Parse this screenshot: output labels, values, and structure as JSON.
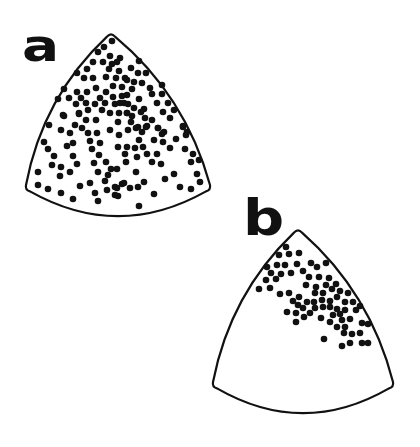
{
  "figure": {
    "background": "#ffffff",
    "stroke_color": "#111111",
    "dot_color": "#111111",
    "dot_radius": 3.3,
    "panels": [
      {
        "label": "a",
        "outline": {
          "top": [
            111,
            33
          ],
          "bottom_left": [
            26,
            189
          ],
          "bottom_right": [
            210,
            189
          ],
          "bottom_sag": 215
        },
        "dots": [
          [
            112,
            41
          ],
          [
            104,
            47
          ],
          [
            110,
            56
          ],
          [
            120,
            58
          ],
          [
            93,
            62
          ],
          [
            103,
            62
          ],
          [
            112,
            64
          ],
          [
            117,
            62
          ],
          [
            87,
            69
          ],
          [
            109,
            69
          ],
          [
            119,
            71
          ],
          [
            77,
            73
          ],
          [
            84,
            78
          ],
          [
            93,
            78
          ],
          [
            106,
            77
          ],
          [
            116,
            78
          ],
          [
            125,
            78
          ],
          [
            64,
            89
          ],
          [
            96,
            88
          ],
          [
            113,
            86
          ],
          [
            122,
            87
          ],
          [
            77,
            92
          ],
          [
            87,
            92
          ],
          [
            106,
            92
          ],
          [
            58,
            99
          ],
          [
            69,
            98
          ],
          [
            81,
            98
          ],
          [
            100,
            98
          ],
          [
            113,
            97
          ],
          [
            122,
            96
          ],
          [
            76,
            104
          ],
          [
            86,
            103
          ],
          [
            95,
            104
          ],
          [
            105,
            103
          ],
          [
            115,
            104
          ],
          [
            124,
            103
          ],
          [
            79,
            113
          ],
          [
            88,
            110
          ],
          [
            102,
            110
          ],
          [
            110,
            113
          ],
          [
            119,
            113
          ],
          [
            127,
            113
          ],
          [
            64,
            116
          ],
          [
            139,
            61
          ],
          [
            131,
            68
          ],
          [
            138,
            73
          ],
          [
            146,
            73
          ],
          [
            127,
            80
          ],
          [
            134,
            82
          ],
          [
            142,
            83
          ],
          [
            132,
            89
          ],
          [
            162,
            85
          ],
          [
            152,
            94
          ],
          [
            162,
            94
          ],
          [
            139,
            99
          ],
          [
            157,
            103
          ],
          [
            168,
            103
          ],
          [
            128,
            104
          ],
          [
            134,
            108
          ],
          [
            144,
            109
          ],
          [
            163,
            112
          ],
          [
            174,
            110
          ],
          [
            127,
            113
          ],
          [
            170,
            118
          ],
          [
            145,
            118
          ],
          [
            152,
            120
          ],
          [
            131,
            122
          ],
          [
            138,
            127
          ],
          [
            147,
            126
          ],
          [
            158,
            128
          ],
          [
            183,
            126
          ],
          [
            187,
            132
          ],
          [
            164,
            132
          ],
          [
            63,
            115
          ],
          [
            79,
            114
          ],
          [
            49,
            125
          ],
          [
            75,
            125
          ],
          [
            82,
            128
          ],
          [
            61,
            130
          ],
          [
            70,
            133
          ],
          [
            88,
            133
          ],
          [
            97,
            133
          ],
          [
            44,
            142
          ],
          [
            73,
            143
          ],
          [
            90,
            141
          ],
          [
            100,
            143
          ],
          [
            48,
            149
          ],
          [
            67,
            146
          ],
          [
            92,
            149
          ],
          [
            54,
            156
          ],
          [
            73,
            156
          ],
          [
            99,
            155
          ],
          [
            106,
            162
          ],
          [
            52,
            165
          ],
          [
            77,
            164
          ],
          [
            94,
            163
          ],
          [
            38,
            172
          ],
          [
            61,
            167
          ],
          [
            70,
            172
          ],
          [
            98,
            172
          ],
          [
            111,
            169
          ],
          [
            60,
            176
          ],
          [
            108,
            175
          ],
          [
            90,
            183
          ],
          [
            105,
            181
          ],
          [
            122,
            184
          ],
          [
            38,
            185
          ],
          [
            48,
            189
          ],
          [
            61,
            193
          ],
          [
            80,
            186
          ],
          [
            95,
            193
          ],
          [
            107,
            190
          ],
          [
            115,
            187
          ],
          [
            115,
            195
          ],
          [
            73,
            199
          ],
          [
            98,
            201
          ],
          [
            128,
            130
          ],
          [
            136,
            128
          ],
          [
            146,
            127
          ],
          [
            158,
            128
          ],
          [
            183,
            127
          ],
          [
            119,
            135
          ],
          [
            142,
            132
          ],
          [
            162,
            134
          ],
          [
            186,
            135
          ],
          [
            139,
            140
          ],
          [
            154,
            140
          ],
          [
            163,
            142
          ],
          [
            176,
            139
          ],
          [
            118,
            147
          ],
          [
            127,
            147
          ],
          [
            135,
            148
          ],
          [
            143,
            147
          ],
          [
            170,
            148
          ],
          [
            185,
            149
          ],
          [
            125,
            154
          ],
          [
            137,
            157
          ],
          [
            147,
            154
          ],
          [
            157,
            154
          ],
          [
            193,
            154
          ],
          [
            126,
            162
          ],
          [
            152,
            162
          ],
          [
            161,
            164
          ],
          [
            191,
            162
          ],
          [
            199,
            160
          ],
          [
            117,
            169
          ],
          [
            136,
            172
          ],
          [
            174,
            174
          ],
          [
            197,
            174
          ],
          [
            165,
            179
          ],
          [
            124,
            183
          ],
          [
            144,
            182
          ],
          [
            200,
            182
          ],
          [
            117,
            188
          ],
          [
            130,
            188
          ],
          [
            138,
            187
          ],
          [
            180,
            187
          ],
          [
            191,
            189
          ],
          [
            118,
            196
          ],
          [
            154,
            194
          ],
          [
            139,
            206
          ],
          [
            98,
            52
          ],
          [
            127,
            95
          ],
          [
            118,
            122
          ],
          [
            110,
            130
          ],
          [
            86,
            120
          ],
          [
            141,
            112
          ],
          [
            150,
            88
          ],
          [
            96,
            120
          ],
          [
            120,
            103
          ],
          [
            132,
            116
          ]
        ]
      },
      {
        "label": "b",
        "outline": {
          "top": [
            298,
            229
          ],
          "bottom_left": [
            213,
            386
          ],
          "bottom_right": [
            393,
            386
          ],
          "bottom_sag": 412
        },
        "dots": [
          [
            286,
            247
          ],
          [
            279,
            255
          ],
          [
            289,
            254
          ],
          [
            299,
            253
          ],
          [
            267,
            267
          ],
          [
            277,
            265
          ],
          [
            285,
            265
          ],
          [
            297,
            264
          ],
          [
            311,
            263
          ],
          [
            326,
            263
          ],
          [
            271,
            273
          ],
          [
            281,
            274
          ],
          [
            291,
            273
          ],
          [
            303,
            271
          ],
          [
            317,
            267
          ],
          [
            266,
            280
          ],
          [
            276,
            279
          ],
          [
            309,
            277
          ],
          [
            319,
            277
          ],
          [
            329,
            278
          ],
          [
            259,
            289
          ],
          [
            270,
            288
          ],
          [
            306,
            285
          ],
          [
            316,
            287
          ],
          [
            326,
            285
          ],
          [
            336,
            284
          ],
          [
            315,
            293
          ],
          [
            323,
            293
          ],
          [
            332,
            289
          ],
          [
            340,
            291
          ],
          [
            348,
            293
          ],
          [
            280,
            294
          ],
          [
            289,
            293
          ],
          [
            299,
            297
          ],
          [
            293,
            301
          ],
          [
            307,
            302
          ],
          [
            314,
            302
          ],
          [
            322,
            300
          ],
          [
            330,
            301
          ],
          [
            337,
            297
          ],
          [
            345,
            302
          ],
          [
            353,
            302
          ],
          [
            360,
            306
          ],
          [
            298,
            305
          ],
          [
            303,
            308
          ],
          [
            315,
            308
          ],
          [
            323,
            307
          ],
          [
            330,
            307
          ],
          [
            337,
            309
          ],
          [
            345,
            310
          ],
          [
            356,
            310
          ],
          [
            287,
            312
          ],
          [
            296,
            313
          ],
          [
            310,
            313
          ],
          [
            333,
            315
          ],
          [
            340,
            314
          ],
          [
            304,
            317
          ],
          [
            321,
            318
          ],
          [
            330,
            322
          ],
          [
            342,
            320
          ],
          [
            296,
            322
          ],
          [
            350,
            319
          ],
          [
            362,
            323
          ],
          [
            368,
            324
          ],
          [
            337,
            327
          ],
          [
            345,
            327
          ],
          [
            344,
            333
          ],
          [
            352,
            334
          ],
          [
            360,
            333
          ],
          [
            324,
            339
          ],
          [
            342,
            346
          ],
          [
            350,
            343
          ],
          [
            362,
            343
          ],
          [
            368,
            343
          ]
        ]
      }
    ]
  }
}
